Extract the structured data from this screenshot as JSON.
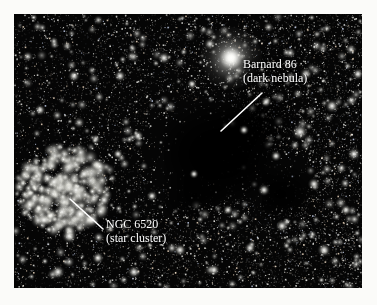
{
  "figure": {
    "kind": "astrophotograph",
    "background_color": "#fbfbf9",
    "plate": {
      "background_color": "#050505",
      "x": 14,
      "y": 14,
      "width": 348,
      "height": 274
    }
  },
  "annotations": [
    {
      "id": "barnard-86",
      "name_line": "Barnard 86",
      "description_line": "(dark nebula)",
      "text_color": "#ffffff",
      "label_x": 243,
      "label_y": 58,
      "leader": {
        "x1": 262,
        "y1": 93,
        "x2": 221,
        "y2": 131
      }
    },
    {
      "id": "ngc-6520",
      "name_line": "NGC 6520",
      "description_line": "(star cluster)",
      "text_color": "#ffffff",
      "label_x": 106,
      "label_y": 218,
      "leader": {
        "x1": 103,
        "y1": 229,
        "x2": 70,
        "y2": 199
      }
    }
  ],
  "features": {
    "dark_nebula": {
      "center_x": 205,
      "center_y": 152,
      "radius_x": 62,
      "radius_y": 52
    },
    "star_cluster": {
      "center_x": 62,
      "center_y": 190,
      "radius": 46
    },
    "bright_star": {
      "center_x": 231,
      "center_y": 58,
      "glow_radius": 31
    }
  }
}
